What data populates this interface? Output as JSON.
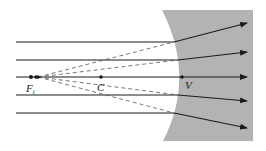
{
  "diagram": {
    "labels": {
      "focal_point": "F",
      "focal_point_sub": "i",
      "center": "C",
      "vertex": "V"
    },
    "colors": {
      "medium": "#b3b3b3",
      "ray": "#1a1a1a",
      "dashed": "#555555"
    },
    "rays": [
      {
        "incident_y": 42,
        "exit_y": 23
      },
      {
        "incident_y": 60,
        "exit_y": 52
      },
      {
        "incident_y": 77,
        "exit_y": 77
      },
      {
        "incident_y": 95,
        "exit_y": 101
      },
      {
        "incident_y": 113,
        "exit_y": 128
      }
    ]
  }
}
